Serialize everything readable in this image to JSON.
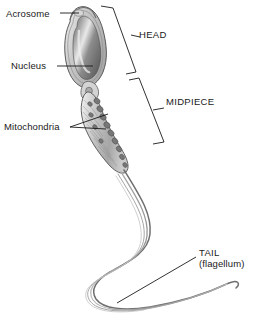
{
  "diagram": {
    "background_color": "#ffffff",
    "ink_color": "#1a1a1a"
  },
  "labels": {
    "acrosome": "Acrosome",
    "nucleus": "Nucleus",
    "mitochondria": "Mitochondria",
    "head": "HEAD",
    "midpiece": "MIDPIECE",
    "tail": "TAIL",
    "tail_sub": "(flagellum)"
  },
  "structures": {
    "head": {
      "name": "head",
      "fill_dark": "#6b6b6b",
      "fill_light": "#d8d8d8",
      "outline": "#3a3a3a"
    },
    "acrosome": {
      "name": "acrosome",
      "fill": "#cfcfcf",
      "outline": "#4a4a4a"
    },
    "nucleus": {
      "name": "nucleus",
      "fill": "#707070",
      "highlight": "#e2e2e2"
    },
    "midpiece": {
      "name": "midpiece",
      "fill": "#c2c2c2",
      "outline": "#555555"
    },
    "mitochondria": {
      "name": "mitochondria",
      "fill": "#7d7d7d",
      "outline": "#4d4d4d",
      "count": 13
    },
    "tail": {
      "name": "tail",
      "stroke": "#8c8c8c",
      "outline": "#5a5a5a"
    }
  },
  "brackets": {
    "head_bracket": "HEAD",
    "midpiece_bracket": "MIDPIECE"
  }
}
